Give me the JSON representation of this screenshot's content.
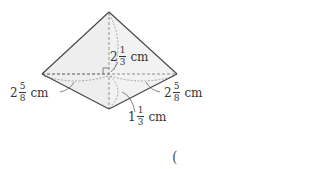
{
  "diagram": {
    "type": "square-pyramid",
    "colors": {
      "face_fill": "#efefef",
      "edge": "#444444",
      "dashed": "#777777",
      "text": "#333333"
    },
    "vertices": {
      "apex": [
        109,
        12
      ],
      "left": [
        42,
        74
      ],
      "right": [
        177,
        74
      ],
      "front": [
        109,
        109
      ],
      "back_center": [
        109,
        74
      ]
    },
    "labels": {
      "height": {
        "whole": "2",
        "num": "1",
        "den": "3",
        "unit": "cm"
      },
      "left_base": {
        "whole": "2",
        "num": "5",
        "den": "8",
        "unit": "cm"
      },
      "right_base": {
        "whole": "2",
        "num": "5",
        "den": "8",
        "unit": "cm"
      },
      "front_base": {
        "whole": "1",
        "num": "1",
        "den": "3",
        "unit": "cm"
      }
    },
    "answer_bracket": "("
  }
}
